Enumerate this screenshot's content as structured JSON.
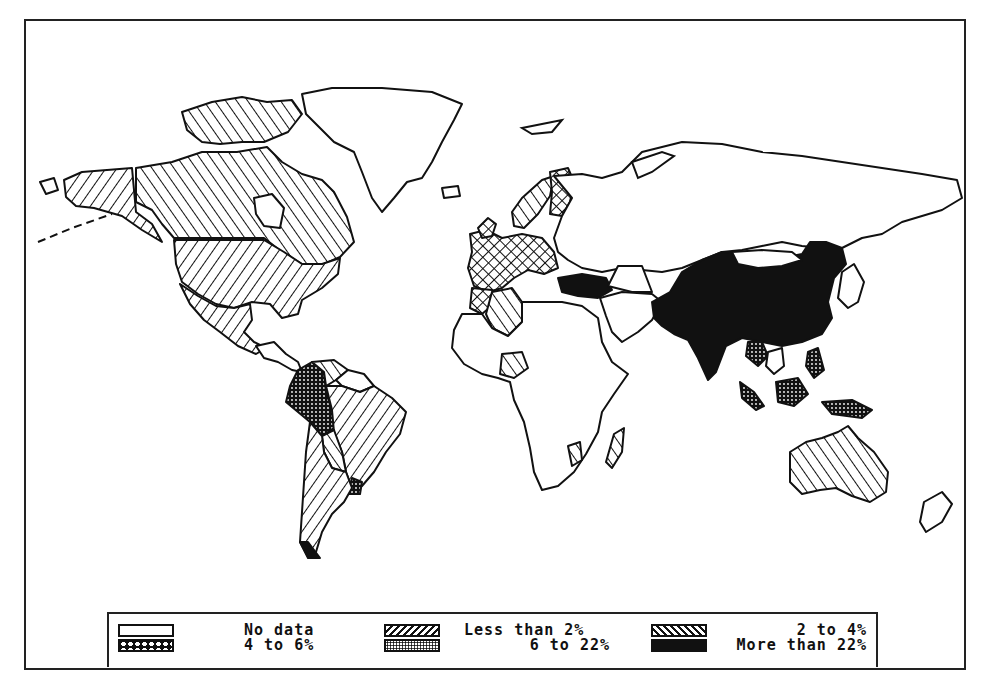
{
  "figure": {
    "type": "choropleth world map",
    "frame": {
      "x": 24,
      "y": 19,
      "width": 942,
      "height": 651
    }
  },
  "legend": {
    "items": [
      {
        "id": "nodata",
        "label": "No data",
        "pattern": "blank",
        "row": 0,
        "col": 0,
        "label_align": "left"
      },
      {
        "id": "lt2",
        "label": "Less than 2%",
        "pattern": "forward-hatch",
        "row": 0,
        "col": 1,
        "label_align": "left"
      },
      {
        "id": "2to4",
        "label": "2 to 4%",
        "pattern": "back-hatch",
        "row": 0,
        "col": 2,
        "label_align": "right"
      },
      {
        "id": "4to6",
        "label": "4 to 6%",
        "pattern": "crosshatch-diamonds",
        "row": 1,
        "col": 0,
        "label_align": "left"
      },
      {
        "id": "6to22",
        "label": "6 to 22%",
        "pattern": "fine-dots",
        "row": 1,
        "col": 1,
        "label_align": "right"
      },
      {
        "id": "gt22",
        "label": "More than 22%",
        "pattern": "solid-black",
        "row": 1,
        "col": 2,
        "label_align": "right"
      }
    ]
  },
  "regions": [
    {
      "name": "Canada",
      "category": "lt2"
    },
    {
      "name": "Alaska",
      "category": "2to4"
    },
    {
      "name": "United States",
      "category": "2to4"
    },
    {
      "name": "Mexico",
      "category": "2to4"
    },
    {
      "name": "Greenland",
      "category": "nodata"
    },
    {
      "name": "Brazil",
      "category": "2to4"
    },
    {
      "name": "Colombia / Peru",
      "category": "6to22"
    },
    {
      "name": "Venezuela",
      "category": "lt2"
    },
    {
      "name": "Argentina / Chile",
      "category": "2to4"
    },
    {
      "name": "Bolivia",
      "category": "lt2"
    },
    {
      "name": "Uruguay",
      "category": "6to22"
    },
    {
      "name": "Norway",
      "category": "lt2"
    },
    {
      "name": "Sweden / Finland",
      "category": "4to6"
    },
    {
      "name": "Western Europe",
      "category": "4to6"
    },
    {
      "name": "Turkey",
      "category": "gt22"
    },
    {
      "name": "Algeria",
      "category": "lt2"
    },
    {
      "name": "Morocco",
      "category": "4to6"
    },
    {
      "name": "Nigeria",
      "category": "lt2"
    },
    {
      "name": "Madagascar",
      "category": "lt2"
    },
    {
      "name": "Mozambique",
      "category": "lt2"
    },
    {
      "name": "Rest of Africa",
      "category": "nodata"
    },
    {
      "name": "Russia / USSR",
      "category": "nodata"
    },
    {
      "name": "Middle East",
      "category": "nodata"
    },
    {
      "name": "China",
      "category": "gt22"
    },
    {
      "name": "India",
      "category": "gt22"
    },
    {
      "name": "Mongolia",
      "category": "nodata"
    },
    {
      "name": "Thailand",
      "category": "6to22"
    },
    {
      "name": "Indonesia / Malaysia",
      "category": "6to22"
    },
    {
      "name": "Philippines",
      "category": "6to22"
    },
    {
      "name": "Japan",
      "category": "nodata"
    },
    {
      "name": "Australia",
      "category": "lt2"
    },
    {
      "name": "New Zealand",
      "category": "nodata"
    }
  ],
  "shapes": [
    {
      "cat": "2to4",
      "d": "M62,178 L80,170 L130,166 L134,210 L150,222 L160,240 L140,228 L120,214 L92,206 L74,204 L64,195 Z"
    },
    {
      "cat": "lt2",
      "d": "M134,166 L170,160 L200,150 L235,150 L265,145 L280,160 L300,172 L320,178 L332,190 L345,215 L352,240 L338,255 L322,262 L300,262 L280,250 L262,236 L240,236 L200,236 L172,236 L160,222 L150,208 L134,200 Z"
    },
    {
      "cat": "lt2",
      "d": "M180,110 L210,100 L240,95 L265,100 L290,98 L300,112 L286,130 L262,140 L240,140 L218,142 L200,140 L185,128 Z"
    },
    {
      "cat": "nodata",
      "d": "M252,196 L270,192 L282,206 L278,226 L262,224 L254,212 Z"
    },
    {
      "cat": "2to4",
      "d": "M172,238 L262,238 L282,250 L300,262 L320,262 L338,256 L336,272 L320,286 L300,298 L296,312 L280,316 L268,302 L250,300 L232,306 L214,302 L196,292 L180,280 L174,262 Z"
    },
    {
      "cat": "2to4",
      "d": "M178,282 L196,294 L214,304 L232,306 L248,302 L250,318 L242,330 L252,340 L264,346 L254,352 L236,344 L218,330 L202,318 L188,302 Z"
    },
    {
      "cat": "nodata",
      "d": "M254,344 L272,340 L284,352 L296,360 L300,370 L290,368 L276,360 L262,356 Z"
    },
    {
      "cat": "nodata",
      "d": "M300,92 L330,86 L380,86 L430,90 L460,102 L452,118 L440,140 L430,160 L420,176 L405,180 L392,196 L380,210 L370,196 L360,170 L352,150 L332,140 L318,126 L304,112 Z"
    },
    {
      "cat": "6to22",
      "d": "M296,368 L310,360 L322,370 L324,390 L330,408 L332,426 L320,434 L308,420 L296,410 L284,400 L288,384 Z"
    },
    {
      "cat": "lt2",
      "d": "M310,360 L332,358 L346,368 L334,378 L324,384 L322,370 Z"
    },
    {
      "cat": "nodata",
      "d": "M346,368 L362,372 L372,384 L358,390 L340,384 L334,378 Z"
    },
    {
      "cat": "2to4",
      "d": "M324,384 L340,384 L358,390 L372,384 L390,396 L404,410 L398,432 L384,450 L372,470 L360,484 L350,486 L344,470 L340,450 L332,430 L330,408 Z"
    },
    {
      "cat": "lt2",
      "d": "M320,434 L332,428 L340,450 L344,470 L330,466 L322,450 Z"
    },
    {
      "cat": "6to22",
      "d": "M350,476 L360,480 L358,492 L346,492 Z"
    },
    {
      "cat": "2to4",
      "d": "M308,420 L320,434 L322,450 L330,466 L344,470 L350,486 L342,500 L330,512 L320,530 L314,550 L306,555 L298,540 L300,510 L302,480 L304,450 Z"
    },
    {
      "cat": "gt22",
      "d": "M298,540 L306,556 L318,556 L312,548 L306,540 Z"
    },
    {
      "cat": "lt2",
      "d": "M520,196 L540,178 L552,174 L548,194 L536,212 L522,226 L512,224 L510,210 Z"
    },
    {
      "cat": "4to6",
      "d": "M548,170 L566,166 L572,180 L568,200 L560,214 L548,212 L550,190 Z"
    },
    {
      "cat": "4to6",
      "d": "M468,232 L484,228 L500,236 L520,232 L540,236 L552,250 L556,266 L542,272 L526,268 L512,276 L500,286 L486,290 L472,284 L466,266 L470,250 Z"
    },
    {
      "cat": "4to6",
      "d": "M476,226 L486,216 L494,222 L490,234 L480,236 Z"
    },
    {
      "cat": "nodata",
      "d": "M552,174 L580,172 L600,176 L620,170 L640,150 L680,140 L720,142 L760,150 L800,154 L840,160 L880,166 L920,172 L955,178 L960,196 L940,208 L920,214 L900,220 L880,232 L860,236 L840,246 L820,246 L800,244 L780,240 L760,244 L740,248 L720,250 L700,258 L680,266 L660,270 L640,268 L620,266 L600,270 L580,266 L566,258 L556,250 L552,236 L560,214 L570,196 Z"
    },
    {
      "cat": "gt22",
      "d": "M556,276 L580,272 L604,276 L610,288 L596,296 L576,294 L560,290 Z"
    },
    {
      "cat": "4to6",
      "d": "M470,286 L490,288 L494,300 L480,312 L468,306 Z"
    },
    {
      "cat": "lt2",
      "d": "M490,290 L510,286 L520,300 L520,320 L506,334 L490,326 L484,312 Z"
    },
    {
      "cat": "nodata",
      "d": "M460,312 L480,312 L490,326 L506,334 L520,320 L520,300 L540,300 L560,300 L580,304 L596,316 L600,340 L610,360 L626,372 L612,392 L600,410 L596,430 L584,452 L572,470 L556,484 L540,488 L532,470 L528,446 L522,420 L512,398 L508,380 L496,376 L480,372 L462,362 L450,346 L452,328 Z"
    },
    {
      "cat": "lt2",
      "d": "M500,352 L520,350 L526,366 L512,376 L498,372 Z"
    },
    {
      "cat": "lt2",
      "d": "M566,444 L578,440 L580,458 L570,464 Z"
    },
    {
      "cat": "lt2",
      "d": "M612,432 L622,426 L620,450 L610,466 L604,460 Z"
    },
    {
      "cat": "nodata",
      "d": "M598,296 L620,290 L650,292 L660,300 L650,318 L636,330 L620,340 L610,330 L604,314 Z"
    },
    {
      "cat": "nodata",
      "d": "M606,284 L616,264 L640,264 L650,290 L630,290 Z"
    },
    {
      "cat": "gt22",
      "d": "M650,300 L668,290 L680,270 L700,258 L720,250 L740,252 L760,260 L780,256 L800,252 L808,240 L824,240 L840,246 L844,262 L832,276 L826,300 L830,316 L820,332 L800,340 L780,344 L760,340 L740,336 L724,344 L714,370 L706,378 L696,356 L686,338 L672,332 L660,324 L652,316 Z"
    },
    {
      "cat": "nodata",
      "d": "M730,250 L760,248 L790,250 L800,258 L780,264 L756,266 L736,262 Z"
    },
    {
      "cat": "6to22",
      "d": "M746,340 L760,340 L766,354 L756,364 L744,354 Z"
    },
    {
      "cat": "nodata",
      "d": "M766,350 L780,346 L782,364 L772,372 L764,364 Z"
    },
    {
      "cat": "6to22",
      "d": "M738,380 L752,390 L762,404 L754,408 L740,396 Z"
    },
    {
      "cat": "6to22",
      "d": "M774,380 L796,376 L806,392 L792,404 L776,400 Z"
    },
    {
      "cat": "6to22",
      "d": "M806,350 L816,346 L822,368 L812,376 L804,364 Z"
    },
    {
      "cat": "6to22",
      "d": "M820,400 L850,398 L870,408 L860,416 L830,412 Z"
    },
    {
      "cat": "nodata",
      "d": "M840,270 L852,262 L862,280 L856,300 L846,306 L836,296 Z"
    },
    {
      "cat": "lt2",
      "d": "M788,450 L804,440 L820,436 L836,430 L846,424 L856,436 L872,450 L886,470 L884,490 L868,500 L850,494 L834,486 L818,488 L800,492 L788,480 Z"
    },
    {
      "cat": "nodata",
      "d": "M922,500 L940,490 L950,502 L940,520 L924,530 L918,520 Z"
    },
    {
      "cat": "nodata",
      "d": "M38,180 L52,176 L56,188 L44,192 Z"
    },
    {
      "cat": "nodata",
      "d": "M440,186 L456,184 L458,194 L442,196 Z"
    }
  ],
  "coastlines": [
    "M520,126 L540,122 L560,118 L550,130 L530,132 Z",
    "M630,160 L660,150 L672,154 L650,170 L636,176 Z",
    "M36,240 L70,226 L110,212"
  ]
}
